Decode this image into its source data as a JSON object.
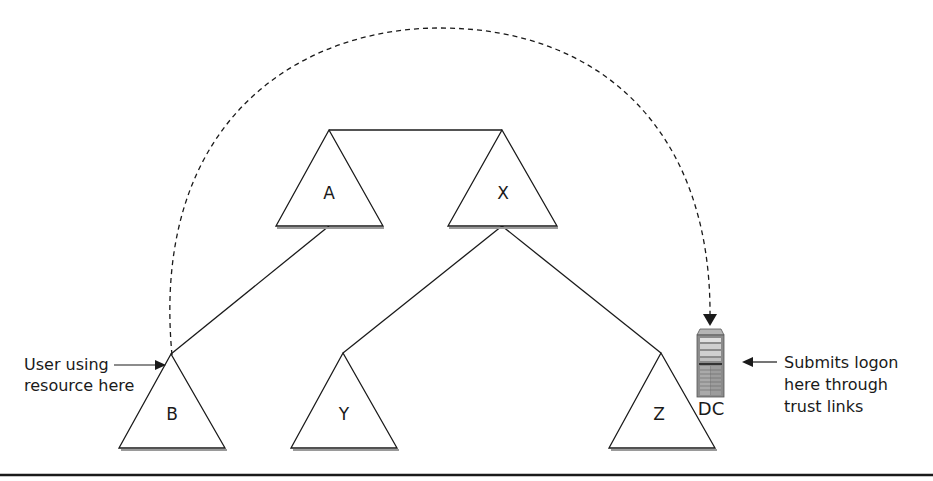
{
  "diagram": {
    "type": "forest-trust-logon-path",
    "colors": {
      "line": "#1a1a1a",
      "shadow": "#9a9a9a",
      "background": "#ffffff",
      "server_body": "#8c8c8c",
      "server_top": "#b5b5b5"
    },
    "domains": [
      {
        "id": "A",
        "label": "A",
        "role": "tree root"
      },
      {
        "id": "X",
        "label": "X",
        "role": "tree root"
      },
      {
        "id": "B",
        "label": "B",
        "role": "child of A"
      },
      {
        "id": "Y",
        "label": "Y",
        "role": "child of X"
      },
      {
        "id": "Z",
        "label": "Z",
        "role": "child of X"
      }
    ],
    "links": [
      {
        "from": "A",
        "to": "X",
        "style": "solid"
      },
      {
        "from": "A",
        "to": "B",
        "style": "solid"
      },
      {
        "from": "X",
        "to": "Y",
        "style": "solid"
      },
      {
        "from": "X",
        "to": "Z",
        "style": "solid"
      },
      {
        "from": "B",
        "to": "DC",
        "style": "dashed",
        "shape": "arc"
      }
    ],
    "server": {
      "label": "DC",
      "icon": "server-tower-icon"
    },
    "annotations": {
      "user": {
        "line1": "User using",
        "line2": "resource here"
      },
      "logon": {
        "line1": "Submits logon",
        "line2": "here through",
        "line3": "trust links"
      }
    }
  }
}
